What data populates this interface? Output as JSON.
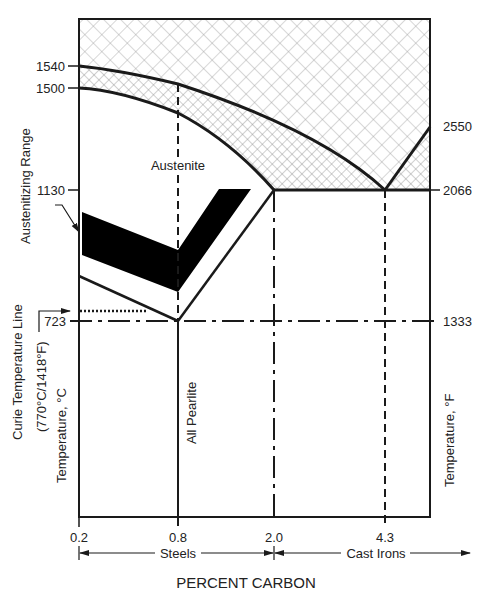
{
  "diagram": {
    "type": "iron-carbon phase diagram (simplified, heat treating)",
    "x_axis": {
      "title": "PERCENT CARBON",
      "ticks": [
        "0.2",
        "0.8",
        "2.0",
        "4.3"
      ],
      "ranges": [
        {
          "label": "Steels",
          "from": "0.2",
          "to": "2.0"
        },
        {
          "label": "Cast Irons",
          "from": "2.0",
          "to": "beyond"
        }
      ]
    },
    "y_axis_left": {
      "title": "Temperature, °C",
      "ticks": [
        "1540",
        "1500",
        "1130",
        "723"
      ]
    },
    "y_axis_right": {
      "title": "Temperature, °F",
      "ticks": [
        "2550",
        "2066",
        "1333"
      ]
    },
    "region_labels": {
      "austenite": "Austenite",
      "all_pearlite": "All Pearlite"
    },
    "annotations": {
      "austenitizing_range": "Austenitizing Range",
      "curie_line_1": "Curie Temperature Line",
      "curie_line_2": "(770°C/1418°F)"
    }
  },
  "colors": {
    "line": "#1a1a1a",
    "hatch": "#8c8c8c",
    "fill_black": "#000000",
    "background": "#ffffff"
  }
}
